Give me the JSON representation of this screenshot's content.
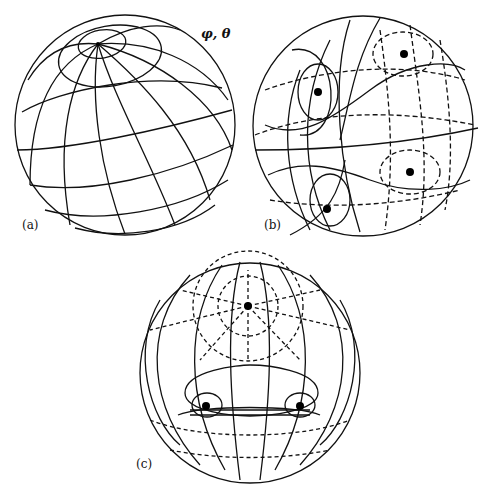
{
  "figure": {
    "panels": [
      {
        "id": "a",
        "label": "(a)",
        "annotation": "φ, θ",
        "description": "Sphere with latitude/longitude grid; single pole at upper left"
      },
      {
        "id": "b",
        "label": "(b)",
        "description": "Sphere with solid and dashed coordinate lines around four singular points"
      },
      {
        "id": "c",
        "label": "(c)",
        "description": "Sphere with solid and dashed curves; dashed lines converge to a pole at top, two singular points below"
      }
    ],
    "colors": {
      "line": "#111111",
      "background": "#ffffff",
      "point": "#000000"
    }
  }
}
